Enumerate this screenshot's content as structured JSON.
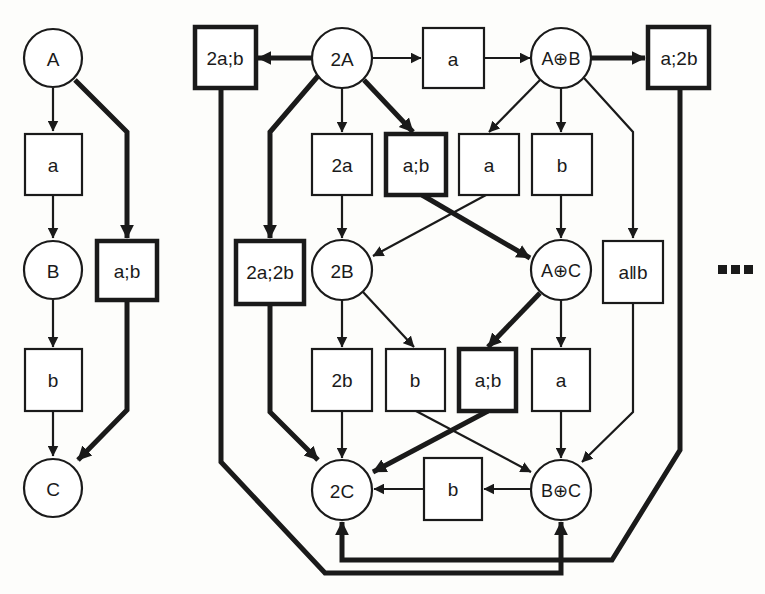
{
  "diagram": {
    "left": {
      "nodes": {
        "A": "A",
        "a": "a",
        "B": "B",
        "ab": "a;b",
        "b": "b",
        "C": "C"
      }
    },
    "right": {
      "nodes": {
        "twoA": "2A",
        "twoA_b": "2a;b",
        "a_top": "a",
        "AplusB": "A⊕B",
        "a_twob": "a;2b",
        "twoa": "2a",
        "ab_1": "a;b",
        "a_mid": "a",
        "b_mid": "b",
        "twoa_twob": "2a;2b",
        "twoB": "2B",
        "AplusC": "A⊕C",
        "a_par_b": "a‖b",
        "twob": "2b",
        "b_low": "b",
        "ab_2": "a;b",
        "a_low": "a",
        "twoC": "2C",
        "b_bottom": "b",
        "BplusC": "B⊕C"
      }
    },
    "ellipsis": "■■■",
    "colors": {
      "ink": "#1a1a1a",
      "paper": "#fdfdfb"
    }
  }
}
